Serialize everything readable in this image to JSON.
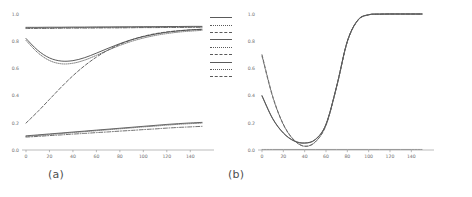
{
  "figure": {
    "background": "#ffffff",
    "panel_a_caption": "(a)",
    "panel_b_caption": "(b)"
  },
  "chart_data": [
    {
      "panel": "a",
      "type": "line",
      "title": "",
      "xlabel": "",
      "ylabel": "",
      "xlim": [
        0,
        150
      ],
      "ylim": [
        0.0,
        1.0
      ],
      "xticks": [
        0,
        20,
        40,
        60,
        80,
        100,
        120,
        140
      ],
      "xtick_labels": [
        "0",
        "20",
        "40",
        "60",
        "80",
        "100",
        "120",
        "140"
      ],
      "yticks": [
        0.0,
        0.2,
        0.4,
        0.6,
        0.8,
        1.0
      ],
      "ytick_labels": [
        "0.0",
        "0.2",
        "0.4",
        "0.6",
        "0.8",
        "1.0"
      ],
      "grid": false,
      "legend_position": "outside-right-top",
      "legend_entries": [
        {
          "label": "",
          "style": "solid"
        },
        {
          "label": "",
          "style": "dotted"
        },
        {
          "label": "",
          "style": "dashdot"
        },
        {
          "label": "",
          "style": "solid"
        },
        {
          "label": "",
          "style": "dotted"
        },
        {
          "label": "",
          "style": "dashdot"
        },
        {
          "label": "",
          "style": "solid"
        },
        {
          "label": "",
          "style": "dotted"
        },
        {
          "label": "",
          "style": "dashdot"
        }
      ],
      "x": [
        0,
        10,
        20,
        30,
        40,
        50,
        60,
        70,
        80,
        90,
        100,
        110,
        120,
        130,
        140,
        150
      ],
      "series": [
        {
          "name": "upper-flat-solid",
          "style": "solid",
          "color": "#4d4d4d",
          "values": [
            0.902,
            0.902,
            0.903,
            0.903,
            0.904,
            0.904,
            0.905,
            0.905,
            0.906,
            0.906,
            0.907,
            0.907,
            0.908,
            0.908,
            0.909,
            0.909
          ]
        },
        {
          "name": "upper-flat-dotted",
          "style": "dotted",
          "color": "#5a5a5a",
          "values": [
            0.898,
            0.898,
            0.899,
            0.9,
            0.9,
            0.901,
            0.901,
            0.902,
            0.902,
            0.903,
            0.903,
            0.904,
            0.904,
            0.905,
            0.905,
            0.906
          ]
        },
        {
          "name": "upper-flat-dashdot",
          "style": "dashdot",
          "color": "#545454",
          "values": [
            0.893,
            0.894,
            0.894,
            0.895,
            0.896,
            0.896,
            0.897,
            0.898,
            0.898,
            0.899,
            0.9,
            0.9,
            0.901,
            0.901,
            0.902,
            0.902
          ]
        },
        {
          "name": "dip-solid",
          "style": "solid",
          "color": "#3d3d3d",
          "values": [
            0.82,
            0.733,
            0.677,
            0.654,
            0.657,
            0.679,
            0.712,
            0.748,
            0.782,
            0.811,
            0.834,
            0.852,
            0.866,
            0.876,
            0.883,
            0.888
          ]
        },
        {
          "name": "dip-dotted",
          "style": "dotted",
          "color": "#636363",
          "values": [
            0.806,
            0.716,
            0.658,
            0.634,
            0.638,
            0.661,
            0.696,
            0.734,
            0.769,
            0.799,
            0.823,
            0.842,
            0.856,
            0.867,
            0.874,
            0.88
          ]
        },
        {
          "name": "rising-dashed",
          "style": "dashed",
          "color": "#4a4a4a",
          "values": [
            0.198,
            0.282,
            0.372,
            0.462,
            0.546,
            0.62,
            0.683,
            0.735,
            0.777,
            0.81,
            0.836,
            0.855,
            0.868,
            0.877,
            0.883,
            0.887
          ]
        },
        {
          "name": "lower-solid",
          "style": "solid",
          "color": "#4d4d4d",
          "values": [
            0.104,
            0.111,
            0.118,
            0.125,
            0.132,
            0.139,
            0.146,
            0.153,
            0.16,
            0.167,
            0.174,
            0.181,
            0.188,
            0.194,
            0.199,
            0.203
          ]
        },
        {
          "name": "lower-dotted",
          "style": "dotted",
          "color": "#626262",
          "values": [
            0.1,
            0.107,
            0.114,
            0.121,
            0.128,
            0.135,
            0.142,
            0.149,
            0.156,
            0.163,
            0.17,
            0.176,
            0.183,
            0.189,
            0.194,
            0.198
          ]
        },
        {
          "name": "lower-dashdot",
          "style": "dashdot",
          "color": "#565656",
          "values": [
            0.095,
            0.1,
            0.106,
            0.111,
            0.117,
            0.122,
            0.128,
            0.133,
            0.139,
            0.144,
            0.15,
            0.155,
            0.161,
            0.166,
            0.17,
            0.174
          ]
        }
      ]
    },
    {
      "panel": "b",
      "type": "line",
      "title": "",
      "xlabel": "",
      "ylabel": "",
      "xlim": [
        0,
        150
      ],
      "ylim": [
        0.0,
        1.0
      ],
      "xticks": [
        0,
        20,
        40,
        60,
        80,
        100,
        120,
        140
      ],
      "xtick_labels": [
        "0",
        "20",
        "40",
        "60",
        "80",
        "100",
        "120",
        "140"
      ],
      "yticks": [
        0.0,
        0.2,
        0.4,
        0.6,
        0.8,
        1.0
      ],
      "ytick_labels": [
        "0.0",
        "0.2",
        "0.4",
        "0.6",
        "0.8",
        "1.0"
      ],
      "grid": false,
      "legend_position": "outside-right-top",
      "legend_entries": [
        {
          "label": "perf",
          "style": "dotted"
        },
        {
          "label": "perf",
          "style": "dashdot"
        },
        {
          "label": "perf",
          "style": "solid"
        },
        {
          "label": "perf",
          "style": "dashed"
        },
        {
          "label": "perf",
          "style": "solid"
        },
        {
          "label": "perf",
          "style": "dotted"
        }
      ],
      "x": [
        0,
        10,
        20,
        30,
        40,
        50,
        60,
        70,
        80,
        90,
        100,
        110,
        120,
        130,
        140,
        150
      ],
      "series": [
        {
          "name": "solid-group",
          "style": "solid",
          "color": "#3d3d3d",
          "values": [
            0.4,
            0.232,
            0.126,
            0.068,
            0.052,
            0.078,
            0.19,
            0.47,
            0.8,
            0.957,
            0.995,
            0.999,
            1.0,
            1.0,
            1.0,
            1.0
          ]
        },
        {
          "name": "solid-group-2",
          "style": "solid",
          "color": "#565656",
          "values": [
            0.396,
            0.229,
            0.124,
            0.066,
            0.05,
            0.076,
            0.188,
            0.468,
            0.798,
            0.956,
            0.994,
            0.999,
            1.0,
            1.0,
            1.0,
            1.0
          ]
        },
        {
          "name": "dashed-group",
          "style": "dashed",
          "color": "#4a4a4a",
          "values": [
            0.7,
            0.396,
            0.19,
            0.074,
            0.028,
            0.06,
            0.183,
            0.466,
            0.797,
            0.955,
            0.994,
            0.999,
            1.0,
            1.0,
            1.0,
            1.0
          ]
        },
        {
          "name": "dashed-group-2",
          "style": "dashed",
          "color": "#6a6a6a",
          "values": [
            0.69,
            0.39,
            0.186,
            0.072,
            0.027,
            0.059,
            0.182,
            0.464,
            0.795,
            0.954,
            0.993,
            0.999,
            1.0,
            1.0,
            1.0,
            1.0
          ]
        },
        {
          "name": "baseline-flat",
          "style": "solid",
          "color": "#8a8a8a",
          "values": [
            0.004,
            0.004,
            0.004,
            0.004,
            0.004,
            0.004,
            0.004,
            0.004,
            0.004,
            0.004,
            0.004,
            0.004,
            0.004,
            0.004,
            0.004,
            0.004
          ]
        }
      ]
    }
  ]
}
